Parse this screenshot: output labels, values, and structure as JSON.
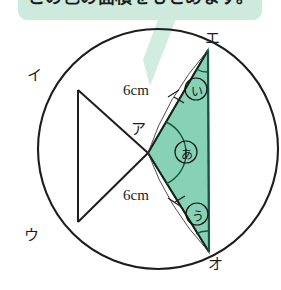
{
  "figure": {
    "balloon": {
      "text": "この色の面積をもとめます。",
      "fill": "#cdeadd",
      "tail": "#c9e9dc"
    },
    "colors": {
      "ink": "#1d1d1d",
      "shade_fill": "#87d2b6",
      "shade_stroke": "#2f7a60",
      "background": "#ffffff"
    },
    "vertex_labels": [
      {
        "name": "a-center",
        "text": "ア"
      },
      {
        "name": "i-upper-left",
        "text": "イ"
      },
      {
        "name": "u-lower-left",
        "text": "ウ"
      },
      {
        "name": "e-upper-right",
        "text": "エ"
      },
      {
        "name": "o-lower-right",
        "text": "オ"
      }
    ],
    "dimension_labels": [
      {
        "name": "radius-upper",
        "text": "6cm"
      },
      {
        "name": "radius-lower",
        "text": "6cm"
      }
    ],
    "angle_labels": [
      {
        "name": "angle-a-center",
        "text": "あ"
      },
      {
        "name": "angle-i-upper",
        "text": "い"
      },
      {
        "name": "angle-u-lower",
        "text": "う"
      }
    ],
    "circle": {
      "cx": 158,
      "cy": 149,
      "r": 120
    },
    "points": {
      "a": {
        "x": 148,
        "y": 153
      },
      "i": {
        "x": 78,
        "y": 90
      },
      "u": {
        "x": 78,
        "y": 222
      },
      "e": {
        "x": 208,
        "y": 50
      },
      "o": {
        "x": 209,
        "y": 252
      }
    }
  }
}
